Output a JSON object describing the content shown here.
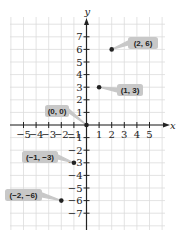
{
  "chart_data": {
    "type": "scatter",
    "title": "",
    "xlabel": "x",
    "ylabel": "y",
    "xlim": [
      -5,
      5
    ],
    "ylim": [
      -7,
      7
    ],
    "grid": true,
    "x_ticks": [
      -5,
      -4,
      -3,
      -2,
      -1,
      1,
      2,
      3,
      4,
      5
    ],
    "x_tick_labels": [
      "−5",
      "−4",
      "−3",
      "−2",
      "−1",
      "1",
      "2",
      "3",
      "4",
      "5"
    ],
    "y_ticks": [
      7,
      6,
      5,
      4,
      3,
      2,
      1,
      -1,
      -2,
      -3,
      -4,
      -5,
      -6,
      -7
    ],
    "y_tick_labels": [
      "7",
      "6",
      "5",
      "4",
      "3",
      "2",
      "1",
      "−1",
      "−2",
      "−3",
      "−4",
      "−5",
      "−6",
      "−7"
    ],
    "points": [
      {
        "x": 2,
        "y": 6,
        "label": "(2, 6)"
      },
      {
        "x": 1,
        "y": 3,
        "label": "(1, 3)"
      },
      {
        "x": 0,
        "y": 0,
        "label": "(0, 0)"
      },
      {
        "x": -1,
        "y": -3,
        "label": "(−1, −3)"
      },
      {
        "x": -2,
        "y": -6,
        "label": "(−2, −6)"
      }
    ]
  },
  "colors": {
    "grid": "#dcdcdc",
    "axis": "#222222",
    "point": "#222222",
    "label_bg": "#c8c8c8"
  }
}
